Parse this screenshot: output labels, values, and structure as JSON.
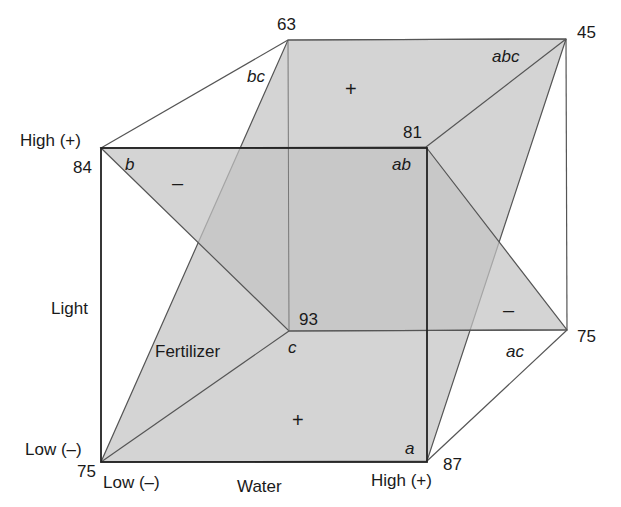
{
  "diagram": {
    "type": "factorial-cube",
    "colors": {
      "plane_fill": "#c4c4c4",
      "plane_fill_opacity": "0.72",
      "edge_dark": "#222222",
      "edge_light": "#555555",
      "background": "#ffffff"
    },
    "factors": {
      "water": {
        "name": "Water",
        "low": "Low (–)",
        "high": "High (+)"
      },
      "light": {
        "name": "Light",
        "low": "Low (–)",
        "high": "High (+)"
      },
      "fertilizer": {
        "name": "Fertilizer"
      }
    },
    "vertices": {
      "one": {
        "treatment": "",
        "value": "75"
      },
      "a": {
        "treatment": "a",
        "value": "87"
      },
      "b": {
        "treatment": "b",
        "value": "84"
      },
      "ab": {
        "treatment": "ab",
        "value": "81"
      },
      "c": {
        "treatment": "c",
        "value": "93"
      },
      "ac": {
        "treatment": "ac",
        "value": "75"
      },
      "bc": {
        "treatment": "bc",
        "value": "63"
      },
      "abc": {
        "treatment": "abc",
        "value": "45"
      }
    },
    "planes": [
      {
        "name": "positive-plane",
        "signs": [
          "+",
          "+"
        ]
      },
      {
        "name": "negative-plane",
        "signs": [
          "–",
          "–"
        ]
      }
    ]
  }
}
